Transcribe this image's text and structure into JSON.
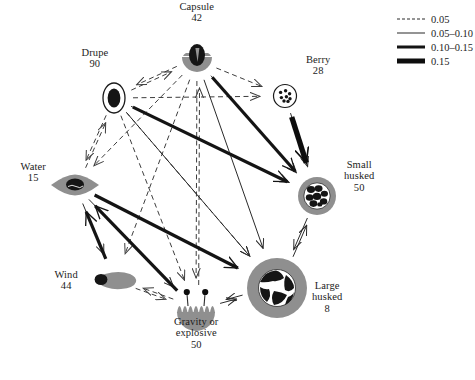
{
  "figure": {
    "type": "network-diagram",
    "background": "#ffffff"
  },
  "legend": {
    "title": "",
    "items": [
      {
        "label": "0.05",
        "style": "dashed",
        "weight": 1,
        "icon": "dashed-line-icon"
      },
      {
        "label": "0.05–0.10",
        "style": "thin",
        "weight": 1,
        "icon": "thin-line-icon"
      },
      {
        "label": "0.10–0.15",
        "style": "medium",
        "weight": 3,
        "icon": "medium-line-icon"
      },
      {
        "label": "0.15",
        "style": "thick",
        "weight": 5,
        "icon": "thick-line-icon"
      }
    ]
  },
  "nodes": [
    {
      "id": "capsule",
      "name": "Capsule",
      "count": "42",
      "icon": "capsule-icon",
      "x": 197,
      "y": 60,
      "r": 17,
      "label_x": 197,
      "label_y": 12,
      "align": "center"
    },
    {
      "id": "drupe",
      "name": "Drupe",
      "count": "90",
      "icon": "drupe-icon",
      "x": 114,
      "y": 98,
      "r": 15,
      "label_x": 95,
      "label_y": 58,
      "align": "center"
    },
    {
      "id": "berry",
      "name": "Berry",
      "count": "28",
      "icon": "berry-icon",
      "x": 285,
      "y": 96,
      "r": 14,
      "label_x": 318,
      "label_y": 65,
      "align": "center"
    },
    {
      "id": "water",
      "name": "Water",
      "count": "15",
      "icon": "water-icon",
      "x": 75,
      "y": 185,
      "r": 16,
      "label_x": 33,
      "label_y": 172,
      "align": "center"
    },
    {
      "id": "small",
      "name": "Small husked",
      "count": "50",
      "icon": "small-husked-icon",
      "x": 317,
      "y": 196,
      "r": 20,
      "label_x": 359,
      "label_y": 176,
      "align": "center"
    },
    {
      "id": "wind",
      "name": "Wind",
      "count": "44",
      "icon": "wind-icon",
      "x": 115,
      "y": 281,
      "r": 18,
      "label_x": 66,
      "label_y": 280,
      "align": "center"
    },
    {
      "id": "large",
      "name": "Large husked",
      "count": "8",
      "icon": "large-husked-icon",
      "x": 277,
      "y": 288,
      "r": 31,
      "label_x": 327,
      "label_y": 297,
      "align": "center"
    },
    {
      "id": "gravity",
      "name": "Gravity or explosive",
      "count": "50",
      "icon": "gravity-icon",
      "x": 196,
      "y": 310,
      "r": 21,
      "label_x": 196,
      "label_y": 333,
      "align": "center"
    }
  ],
  "node_label_lines": {
    "capsule": [
      "Capsule",
      "42"
    ],
    "drupe": [
      "Drupe",
      "90"
    ],
    "berry": [
      "Berry",
      "28"
    ],
    "water": [
      "Water",
      "15"
    ],
    "small": [
      "Small",
      "husked",
      "50"
    ],
    "wind": [
      "Wind",
      "44"
    ],
    "large": [
      "Large",
      "husked",
      "8"
    ],
    "gravity": [
      "Gravity or",
      "explosive",
      "50"
    ]
  },
  "edges": [
    {
      "from": "drupe",
      "to": "capsule",
      "style": "dashed"
    },
    {
      "from": "capsule",
      "to": "drupe",
      "style": "dashed"
    },
    {
      "from": "capsule",
      "to": "berry",
      "style": "dashed"
    },
    {
      "from": "drupe",
      "to": "berry",
      "style": "dashed"
    },
    {
      "from": "capsule",
      "to": "water",
      "style": "dashed"
    },
    {
      "from": "drupe",
      "to": "water",
      "style": "dashed"
    },
    {
      "from": "water",
      "to": "drupe",
      "style": "dashed"
    },
    {
      "from": "capsule",
      "to": "gravity",
      "style": "dashed"
    },
    {
      "from": "gravity",
      "to": "capsule",
      "style": "dashed"
    },
    {
      "from": "capsule",
      "to": "wind",
      "style": "dashed"
    },
    {
      "from": "drupe",
      "to": "gravity",
      "style": "dashed"
    },
    {
      "from": "drupe",
      "to": "large",
      "style": "dashed"
    },
    {
      "from": "capsule",
      "to": "small",
      "style": "dashed"
    },
    {
      "from": "wind",
      "to": "gravity",
      "style": "dashed"
    },
    {
      "from": "gravity",
      "to": "wind",
      "style": "dashed"
    },
    {
      "from": "capsule",
      "to": "large",
      "style": "thin"
    },
    {
      "from": "drupe",
      "to": "small",
      "style": "thin"
    },
    {
      "from": "berry",
      "to": "small",
      "style": "thin"
    },
    {
      "from": "small",
      "to": "large",
      "style": "thin"
    },
    {
      "from": "large",
      "to": "small",
      "style": "thin"
    },
    {
      "from": "gravity",
      "to": "large",
      "style": "thin"
    },
    {
      "from": "large",
      "to": "gravity",
      "style": "thin"
    },
    {
      "from": "water",
      "to": "wind",
      "style": "thin"
    },
    {
      "from": "water",
      "to": "gravity",
      "style": "thin"
    },
    {
      "from": "drupe",
      "to": "large",
      "style": "thin"
    },
    {
      "from": "capsule",
      "to": "small",
      "style": "medium"
    },
    {
      "from": "drupe",
      "to": "small",
      "style": "medium"
    },
    {
      "from": "water",
      "to": "large",
      "style": "medium"
    },
    {
      "from": "gravity",
      "to": "water",
      "style": "medium"
    },
    {
      "from": "wind",
      "to": "water",
      "style": "medium"
    },
    {
      "from": "berry",
      "to": "small",
      "style": "thick"
    }
  ],
  "colors": {
    "line": "#1a1a1a",
    "dashed": "#3d3d3d",
    "node_gray": "#8f8f8f",
    "node_dark": "#151515",
    "text": "#1c1c1c"
  }
}
